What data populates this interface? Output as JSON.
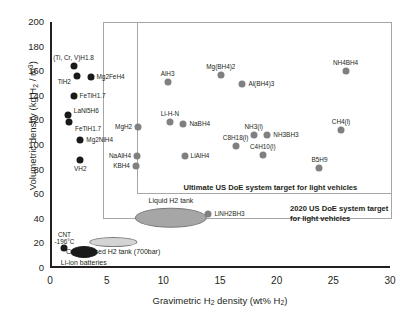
{
  "chart_data": {
    "type": "scatter",
    "title": "",
    "xlabel": "Gravimetric H2 density (wt% H2)",
    "ylabel": "Volumetric density (kg H2 / m3)",
    "xlim": [
      0,
      30
    ],
    "ylim": [
      0,
      200
    ],
    "xticks": [
      0,
      5,
      10,
      15,
      20,
      25,
      30
    ],
    "yticks": [
      0,
      20,
      40,
      60,
      80,
      100,
      120,
      140,
      160,
      180,
      200
    ],
    "grid": false,
    "legend": "none",
    "series": [
      {
        "name": "Metal hydrides",
        "color": "#1a1a1a",
        "points": [
          {
            "label": "(Ti, Cr, V)H1.8",
            "x": 1.9,
            "y": 164,
            "label_pos": "above"
          },
          {
            "label": "TiH2",
            "x": 2.2,
            "y": 156,
            "label_pos": "left-below"
          },
          {
            "label": "Mg2FeH4",
            "x": 3.4,
            "y": 155,
            "label_pos": "right"
          },
          {
            "label": "FeTiH1.7",
            "x": 1.9,
            "y": 140,
            "label_pos": "right"
          },
          {
            "label": "LaNi5H6",
            "x": 1.4,
            "y": 124,
            "label_pos": "right-above"
          },
          {
            "label": "FeTiH1.7",
            "x": 1.5,
            "y": 119,
            "label_pos": "right-below"
          },
          {
            "label": "Mg2NiH4",
            "x": 2.5,
            "y": 104,
            "label_pos": "right"
          },
          {
            "label": "VH2",
            "x": 2.5,
            "y": 88,
            "label_pos": "below"
          },
          {
            "label": "CNT -196°C",
            "x": 1.1,
            "y": 16,
            "label_pos": "above"
          }
        ]
      },
      {
        "name": "Complex and chemical hydrides",
        "color": "#808080",
        "points": [
          {
            "label": "MgH2",
            "x": 7.6,
            "y": 115,
            "label_pos": "left"
          },
          {
            "label": "NaAlH4",
            "x": 7.5,
            "y": 91,
            "label_pos": "left"
          },
          {
            "label": "KBH4",
            "x": 7.4,
            "y": 83,
            "label_pos": "left"
          },
          {
            "label": "AlH3",
            "x": 10.2,
            "y": 151,
            "label_pos": "above"
          },
          {
            "label": "Li-H-N",
            "x": 10.4,
            "y": 119,
            "label_pos": "above"
          },
          {
            "label": "NaBH4",
            "x": 11.6,
            "y": 117,
            "label_pos": "right"
          },
          {
            "label": "LiAlH4",
            "x": 11.7,
            "y": 91,
            "label_pos": "right"
          },
          {
            "label": "Mg(BH4)2",
            "x": 14.9,
            "y": 157,
            "label_pos": "above"
          },
          {
            "label": "Al(BH4)3",
            "x": 16.8,
            "y": 150,
            "label_pos": "right"
          },
          {
            "label": "NH3(l)",
            "x": 17.8,
            "y": 108,
            "label_pos": "above"
          },
          {
            "label": "NH3BH3",
            "x": 19.0,
            "y": 108,
            "label_pos": "right"
          },
          {
            "label": "C8H18(l)",
            "x": 16.2,
            "y": 99,
            "label_pos": "above"
          },
          {
            "label": "C4H10(l)",
            "x": 18.6,
            "y": 92,
            "label_pos": "above"
          },
          {
            "label": "B5H9",
            "x": 23.6,
            "y": 81,
            "label_pos": "above"
          },
          {
            "label": "NH4BH4",
            "x": 25.9,
            "y": 160,
            "label_pos": "above"
          },
          {
            "label": "CH4(l)",
            "x": 25.5,
            "y": 112,
            "label_pos": "above"
          },
          {
            "label": "LiNH2BH3",
            "x": 13.8,
            "y": 44,
            "label_pos": "right"
          }
        ]
      }
    ],
    "regions": [
      {
        "name": "Liquid H2 tank",
        "shape": "ellipse",
        "x": 10.5,
        "y": 41,
        "rx": 3.1,
        "ry": 7.5,
        "fill": "#a6a6a6",
        "label_pos": "above"
      },
      {
        "name": "Compressed H2 tank (700bar)",
        "shape": "ellipse",
        "x": 5.4,
        "y": 21,
        "rx": 2.0,
        "ry": 3.2,
        "fill": "#d4d4d4",
        "label_pos": "below"
      },
      {
        "name": "Li-ion batteries",
        "shape": "ellipse",
        "x": 2.8,
        "y": 13,
        "rx": 1.1,
        "ry": 4.0,
        "fill": "#1a1a1a",
        "label_pos": "below"
      }
    ],
    "annotations": [
      {
        "name": "ultimate-doe-target",
        "text": "Ultimate US DoE system target for light vehicles",
        "box": {
          "x0": 7.5,
          "y0": 60,
          "x1": 30.0,
          "y1": 200
        }
      },
      {
        "name": "doe-2020-target",
        "text": "2020 US DoE system target for light vehicles",
        "box": {
          "x0": 4.5,
          "y0": 40,
          "x1": 30.0,
          "y1": 200
        }
      }
    ]
  },
  "axes": {
    "y_ticks": [
      "200",
      "180",
      "160",
      "140",
      "120",
      "100",
      "80",
      "60",
      "40",
      "20",
      "0"
    ],
    "x_ticks": [
      "0",
      "5",
      "10",
      "15",
      "20",
      "25",
      "30"
    ],
    "y_title_pre": "Volumetric density (kg H",
    "y_title_sub": "2",
    "y_title_mid": " / m",
    "y_title_sup": "3",
    "y_title_post": ")",
    "x_title_pre": "Gravimetric H",
    "x_title_sub": "2",
    "x_title_mid": " density (wt% H",
    "x_title_sub2": "2",
    "x_title_post": ")"
  },
  "labels": {
    "ultimate_target": "Ultimate US DoE system target for light vehicles",
    "target_2020_line1": "2020 US DoE system target",
    "target_2020_line2": "for light vehicles",
    "liquid_tank": "Liquid H2 tank",
    "compressed_tank": "Compressed H2 tank (700bar)",
    "liion": "Li-ion batteries",
    "cnt_line1": "CNT",
    "cnt_line2": "-196°C"
  },
  "colors": {
    "dark_point": "#1a1a1a",
    "gray_point": "#808080",
    "axis": "#231f20",
    "target_border": "#a6a6a6"
  }
}
